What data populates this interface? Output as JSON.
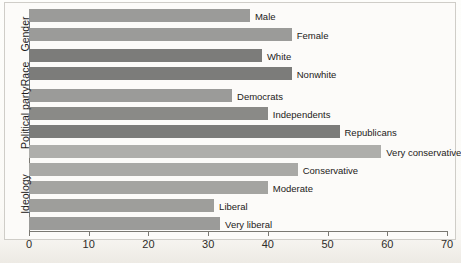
{
  "chart_data": {
    "type": "bar",
    "orientation": "horizontal",
    "title": "",
    "xlabel": "",
    "ylabel": "",
    "xlim": [
      0,
      70
    ],
    "xticks": [
      0,
      10,
      20,
      30,
      40,
      50,
      60,
      70
    ],
    "grid": false,
    "legend": false,
    "groups": [
      {
        "name": "Gender",
        "color": "#9b9b99",
        "categories": [
          "Male",
          "Female"
        ],
        "values": [
          37,
          44
        ]
      },
      {
        "name": "Race",
        "color": "#7c7c7a",
        "categories": [
          "White",
          "Nonwhite"
        ],
        "values": [
          39,
          44
        ]
      },
      {
        "name": "Political party",
        "color": "#7c7c7a",
        "categories": [
          "Democrats",
          "Independents",
          "Republicans"
        ],
        "values": [
          34,
          40,
          52
        ]
      },
      {
        "name": "Ideology",
        "color": "#a9a9a6",
        "categories": [
          "Very conservative",
          "Conservative",
          "Moderate",
          "Liberal",
          "Very liberal"
        ],
        "values": [
          59,
          45,
          40,
          31,
          32
        ]
      }
    ],
    "categories": [
      "Male",
      "Female",
      "White",
      "Nonwhite",
      "Democrats",
      "Independents",
      "Republicans",
      "Very conservative",
      "Conservative",
      "Moderate",
      "Liberal",
      "Very liberal"
    ],
    "values": [
      37,
      44,
      39,
      44,
      34,
      40,
      52,
      59,
      45,
      40,
      31,
      32
    ]
  },
  "axis": {
    "ticks": [
      {
        "label": "0",
        "value": 0
      },
      {
        "label": "10",
        "value": 10
      },
      {
        "label": "20",
        "value": 20
      },
      {
        "label": "30",
        "value": 30
      },
      {
        "label": "40",
        "value": 40
      },
      {
        "label": "50",
        "value": 50
      },
      {
        "label": "60",
        "value": 60
      },
      {
        "label": "70",
        "value": 70
      }
    ]
  },
  "group_labels": [
    {
      "text": "Gender"
    },
    {
      "text": "Race"
    },
    {
      "text": "Political party"
    },
    {
      "text": "Ideology"
    }
  ],
  "bars": [
    {
      "label": "Male",
      "value": 37,
      "color": "#9b9b99"
    },
    {
      "label": "Female",
      "value": 44,
      "color": "#9b9b99"
    },
    {
      "label": "White",
      "value": 39,
      "color": "#7c7c7a"
    },
    {
      "label": "Nonwhite",
      "value": 44,
      "color": "#7c7c7a"
    },
    {
      "label": "Democrats",
      "value": 34,
      "color": "#9b9b99"
    },
    {
      "label": "Independents",
      "value": 40,
      "color": "#8a8a87"
    },
    {
      "label": "Republicans",
      "value": 52,
      "color": "#7c7c7a"
    },
    {
      "label": "Very conservative",
      "value": 59,
      "color": "#aeaeab"
    },
    {
      "label": "Conservative",
      "value": 45,
      "color": "#a9a9a6"
    },
    {
      "label": "Moderate",
      "value": 40,
      "color": "#a4a4a1"
    },
    {
      "label": "Liberal",
      "value": 31,
      "color": "#9e9e9b"
    },
    {
      "label": "Very liberal",
      "value": 32,
      "color": "#9b9b99"
    }
  ]
}
